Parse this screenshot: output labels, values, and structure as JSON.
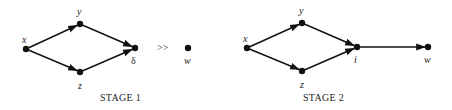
{
  "diagram": {
    "colors": {
      "ink": "#111111",
      "background": "#ffffff"
    },
    "separator": ">>",
    "stages": [
      {
        "caption": "STAGE 1",
        "nodes": [
          {
            "id": "x",
            "label": "x",
            "pos": [
              26,
              49
            ]
          },
          {
            "id": "y",
            "label": "y",
            "pos": [
              80,
              24
            ]
          },
          {
            "id": "z",
            "label": "z",
            "pos": [
              80,
              72
            ]
          },
          {
            "id": "delta",
            "label": "δ",
            "pos": [
              135,
              48
            ]
          },
          {
            "id": "w",
            "label": "w",
            "pos": [
              188,
              48
            ]
          }
        ],
        "edges": [
          {
            "from": "x",
            "to": "y"
          },
          {
            "from": "x",
            "to": "z"
          },
          {
            "from": "y",
            "to": "delta"
          },
          {
            "from": "z",
            "to": "delta"
          }
        ]
      },
      {
        "caption": "STAGE 2",
        "nodes": [
          {
            "id": "x",
            "label": "x",
            "pos": [
              247,
              48
            ]
          },
          {
            "id": "y",
            "label": "y",
            "pos": [
              302,
              23
            ]
          },
          {
            "id": "z",
            "label": "z",
            "pos": [
              302,
              71
            ]
          },
          {
            "id": "i",
            "label": "i",
            "pos": [
              357,
              47
            ]
          },
          {
            "id": "w",
            "label": "w",
            "pos": [
              428,
              47
            ]
          }
        ],
        "edges": [
          {
            "from": "x",
            "to": "y"
          },
          {
            "from": "x",
            "to": "z"
          },
          {
            "from": "y",
            "to": "i"
          },
          {
            "from": "z",
            "to": "i"
          },
          {
            "from": "i",
            "to": "w"
          }
        ]
      }
    ]
  }
}
